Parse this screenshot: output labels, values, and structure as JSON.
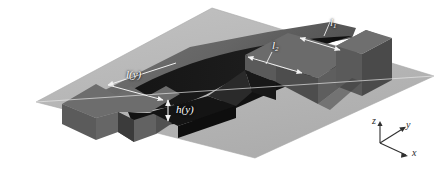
{
  "figure": {
    "kind": "3d-isometric-schematic",
    "background_color": "#ffffff",
    "colors": {
      "base_plane": "#b9b9b9",
      "base_plane_edge": "#a3a3a3",
      "top_face": "#6e6e6e",
      "top_face_shaded": "#5c5c5c",
      "side_face": "#6a6a6a",
      "side_face_dark": "#4e4e4e",
      "groove_dark": "#1a1a1a",
      "groove_shadow": "#111111",
      "wall_face": "#575757",
      "leader_line": "#f2f2f2",
      "label_text": "#ffffff",
      "axis_line": "#2f2f2f",
      "axis_text": "#2a2a2a"
    }
  },
  "annotations": [
    {
      "id": "ly",
      "text": "l(y)",
      "kind": "dimension-label",
      "measures": "groove land length as a function of y"
    },
    {
      "id": "hy",
      "text": "h(y)",
      "kind": "dimension-label",
      "measures": "groove depth as a function of y"
    },
    {
      "id": "l2",
      "text": "l",
      "sub": "2",
      "kind": "dimension-label",
      "measures": "second characteristic length"
    },
    {
      "id": "l1",
      "text": "l",
      "sub": "1",
      "kind": "dimension-label",
      "measures": "first characteristic length"
    }
  ],
  "axes": {
    "z": "z",
    "y": "y",
    "x": "x"
  }
}
